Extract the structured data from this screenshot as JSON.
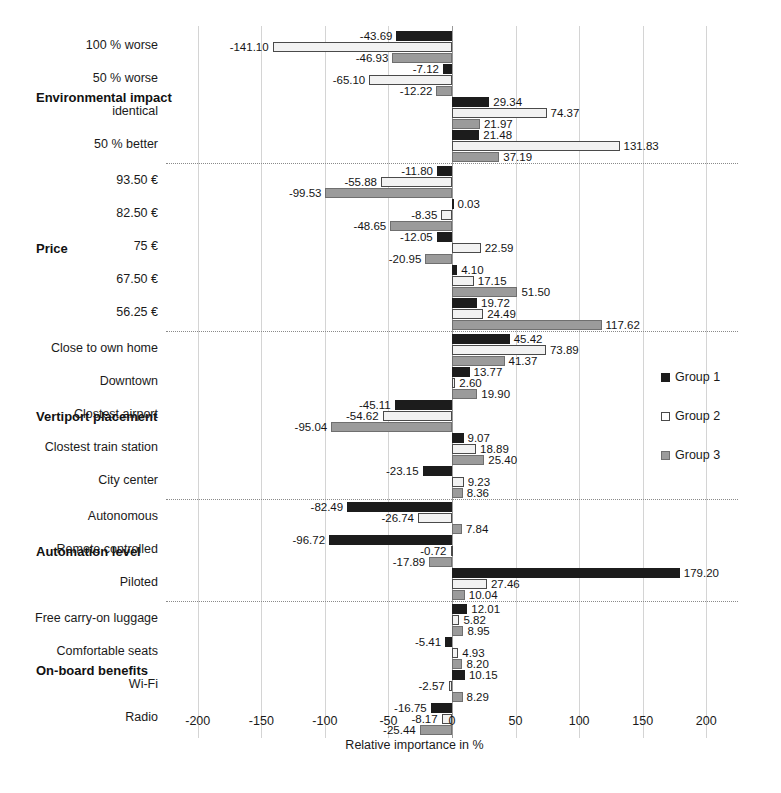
{
  "chart_data": {
    "type": "bar",
    "orientation": "horizontal",
    "title": "",
    "xlabel": "Relative importance in %",
    "ylabel": "",
    "xlim": [
      -225,
      225
    ],
    "xticks": [
      -200,
      -150,
      -100,
      -50,
      0,
      50,
      100,
      150,
      200
    ],
    "xtick_labels": [
      "-200",
      "-150",
      "-100",
      "-50",
      "0",
      "50",
      "100",
      "150",
      "200"
    ],
    "grid": true,
    "legend_position": "right",
    "series": [
      {
        "name": "Group 1",
        "color": "#1c1c1c",
        "style": "solid-black"
      },
      {
        "name": "Group 2",
        "color": "#ffffff",
        "style": "outline-white"
      },
      {
        "name": "Group 3",
        "color": "#9b9b9b",
        "style": "solid-gray"
      }
    ],
    "groups": [
      {
        "attribute": "Environmental impact",
        "levels": [
          {
            "label": "100 % worse",
            "values": [
              -43.69,
              -141.1,
              -46.93
            ]
          },
          {
            "label": "50 % worse",
            "values": [
              -7.12,
              -65.1,
              -12.22
            ]
          },
          {
            "label": "identical",
            "values": [
              29.34,
              74.37,
              21.97
            ]
          },
          {
            "label": "50 % better",
            "values": [
              21.48,
              131.83,
              37.19
            ]
          }
        ]
      },
      {
        "attribute": "Price",
        "levels": [
          {
            "label": "93.50 €",
            "values": [
              -11.8,
              -55.88,
              -99.53
            ]
          },
          {
            "label": "82.50 €",
            "values": [
              0.03,
              -8.35,
              -48.65
            ]
          },
          {
            "label": "75 €",
            "values": [
              -12.05,
              22.59,
              -20.95
            ]
          },
          {
            "label": "67.50 €",
            "values": [
              4.1,
              17.15,
              51.5
            ]
          },
          {
            "label": "56.25 €",
            "values": [
              19.72,
              24.49,
              117.62
            ]
          }
        ]
      },
      {
        "attribute": "Vertiport placement",
        "levels": [
          {
            "label": "Close to own home",
            "values": [
              45.42,
              73.89,
              41.37
            ]
          },
          {
            "label": "Downtown",
            "values": [
              13.77,
              2.6,
              19.9
            ]
          },
          {
            "label": "Clostest airport",
            "values": [
              -45.11,
              -54.62,
              -95.04
            ]
          },
          {
            "label": "Clostest train station",
            "values": [
              9.07,
              18.89,
              25.4
            ]
          },
          {
            "label": "City center",
            "values": [
              -23.15,
              9.23,
              8.36
            ]
          }
        ]
      },
      {
        "attribute": "Automation level",
        "levels": [
          {
            "label": "Autonomous",
            "values": [
              -82.49,
              -26.74,
              7.84
            ]
          },
          {
            "label": "Remote controlled",
            "values": [
              -96.72,
              -0.72,
              -17.89
            ]
          },
          {
            "label": "Piloted",
            "values": [
              179.2,
              27.46,
              10.04
            ]
          }
        ]
      },
      {
        "attribute": "On-board benefits",
        "levels": [
          {
            "label": "Free carry-on luggage",
            "values": [
              12.01,
              5.82,
              8.95
            ]
          },
          {
            "label": "Comfortable seats",
            "values": [
              -5.41,
              4.93,
              8.2
            ]
          },
          {
            "label": "Wi-Fi",
            "values": [
              10.15,
              -2.57,
              8.29
            ]
          },
          {
            "label": "Radio",
            "values": [
              -16.75,
              -8.17,
              -25.44
            ]
          }
        ]
      }
    ]
  }
}
